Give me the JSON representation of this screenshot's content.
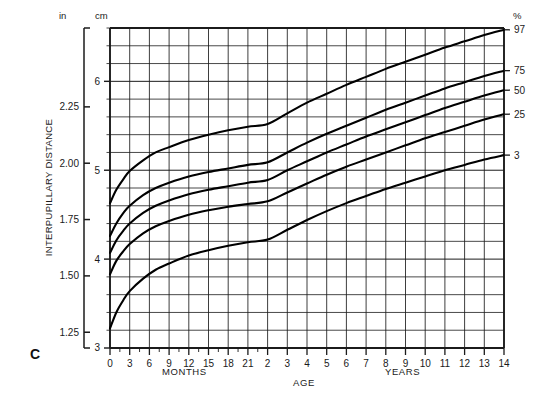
{
  "figure": {
    "panel_letter": "C",
    "y_axis_title": "INTERPUPILLARY DISTANCE",
    "x_axis_title": "AGE",
    "unit_left": "in",
    "unit_mid": "cm",
    "unit_right": "%",
    "x_group_left": "MONTHS",
    "x_group_right": "YEARS"
  },
  "chart_data": {
    "type": "line",
    "title": "Interpupillary Distance",
    "xlabel": "AGE",
    "ylabel": "INTERPUPILLARY DISTANCE",
    "y_unit_primary": "cm",
    "y_unit_secondary": "in",
    "ylim_cm": [
      3,
      6.6
    ],
    "ylim_in": [
      1.18,
      2.6
    ],
    "grid": true,
    "legend_position": "right-edge-percentile-labels",
    "y_ticks_cm": [
      "3",
      "4",
      "5",
      "6"
    ],
    "y_ticks_cm_values": [
      3,
      4,
      5,
      6
    ],
    "y_ticks_in": [
      "1.25",
      "1.50",
      "1.75",
      "2.00",
      "2.25"
    ],
    "y_ticks_in_values": [
      1.25,
      1.5,
      1.75,
      2.0,
      2.25
    ],
    "x_tick_labels_months": [
      "0",
      "3",
      "6",
      "9",
      "12",
      "15",
      "18",
      "21"
    ],
    "x_tick_labels_years": [
      "2",
      "3",
      "4",
      "5",
      "6",
      "7",
      "8",
      "9",
      "10",
      "11",
      "12",
      "13",
      "14"
    ],
    "x_tick_values_years": [
      0,
      0.25,
      0.5,
      0.75,
      1.0,
      1.25,
      1.5,
      1.75,
      2,
      3,
      4,
      5,
      6,
      7,
      8,
      9,
      10,
      11,
      12,
      13,
      14
    ],
    "percentile_labels": [
      "97",
      "75",
      "50",
      "25",
      "3"
    ],
    "series": [
      {
        "name": "97",
        "label": "97",
        "x": [
          0,
          0.08,
          0.17,
          0.25,
          0.42,
          0.58,
          0.75,
          1.0,
          1.25,
          1.5,
          1.75,
          2.0,
          3,
          4,
          5,
          6,
          7,
          8,
          9,
          10,
          11,
          12,
          13,
          14
        ],
        "values": [
          4.63,
          4.78,
          4.9,
          4.99,
          5.11,
          5.2,
          5.26,
          5.34,
          5.4,
          5.45,
          5.49,
          5.52,
          5.64,
          5.76,
          5.86,
          5.96,
          6.05,
          6.14,
          6.22,
          6.3,
          6.38,
          6.45,
          6.52,
          6.58
        ]
      },
      {
        "name": "75",
        "label": "75",
        "x": [
          0,
          0.08,
          0.17,
          0.25,
          0.42,
          0.58,
          0.75,
          1.0,
          1.25,
          1.5,
          1.75,
          2.0,
          3,
          4,
          5,
          6,
          7,
          8,
          9,
          10,
          11,
          12,
          13,
          14
        ],
        "values": [
          4.26,
          4.4,
          4.52,
          4.6,
          4.72,
          4.8,
          4.86,
          4.93,
          4.98,
          5.02,
          5.06,
          5.09,
          5.2,
          5.31,
          5.41,
          5.5,
          5.59,
          5.68,
          5.76,
          5.84,
          5.92,
          5.99,
          6.06,
          6.12
        ]
      },
      {
        "name": "50",
        "label": "50",
        "x": [
          0,
          0.08,
          0.17,
          0.25,
          0.42,
          0.58,
          0.75,
          1.0,
          1.25,
          1.5,
          1.75,
          2.0,
          3,
          4,
          5,
          6,
          7,
          8,
          9,
          10,
          11,
          12,
          13,
          14
        ],
        "values": [
          4.07,
          4.21,
          4.32,
          4.4,
          4.52,
          4.6,
          4.66,
          4.73,
          4.78,
          4.82,
          4.86,
          4.89,
          5.0,
          5.1,
          5.2,
          5.29,
          5.38,
          5.46,
          5.54,
          5.62,
          5.7,
          5.77,
          5.84,
          5.9
        ]
      },
      {
        "name": "25",
        "label": "25",
        "x": [
          0,
          0.08,
          0.17,
          0.25,
          0.42,
          0.58,
          0.75,
          1.0,
          1.25,
          1.5,
          1.75,
          2.0,
          3,
          4,
          5,
          6,
          7,
          8,
          9,
          10,
          11,
          12,
          13,
          14
        ],
        "values": [
          3.83,
          3.98,
          4.09,
          4.17,
          4.29,
          4.37,
          4.43,
          4.5,
          4.55,
          4.59,
          4.62,
          4.65,
          4.75,
          4.85,
          4.95,
          5.04,
          5.12,
          5.2,
          5.28,
          5.36,
          5.43,
          5.5,
          5.57,
          5.63
        ]
      },
      {
        "name": "3",
        "label": "3",
        "x": [
          0,
          0.08,
          0.17,
          0.25,
          0.42,
          0.58,
          0.75,
          1.0,
          1.25,
          1.5,
          1.75,
          2.0,
          3,
          4,
          5,
          6,
          7,
          8,
          9,
          10,
          11,
          12,
          13,
          14
        ],
        "values": [
          3.22,
          3.4,
          3.54,
          3.64,
          3.78,
          3.88,
          3.95,
          4.04,
          4.1,
          4.15,
          4.19,
          4.22,
          4.33,
          4.44,
          4.54,
          4.63,
          4.71,
          4.79,
          4.86,
          4.93,
          5.0,
          5.06,
          5.12,
          5.17
        ]
      }
    ]
  }
}
